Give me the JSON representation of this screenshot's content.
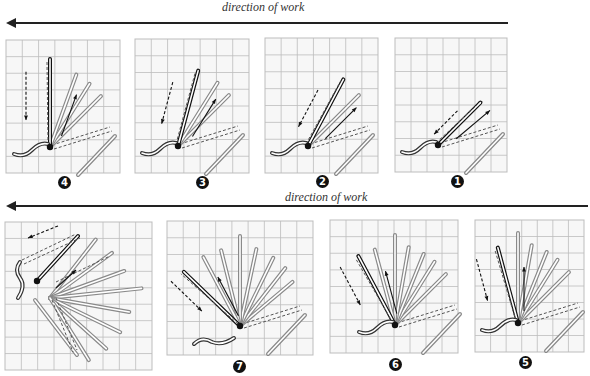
{
  "rows": [
    {
      "direction_label": "direction of work"
    },
    {
      "direction_label": "direction of work"
    }
  ],
  "panels": [
    {
      "id": "p4",
      "step": "4",
      "stage": 4,
      "variant": "fan"
    },
    {
      "id": "p3",
      "step": "3",
      "stage": 3,
      "variant": "fan"
    },
    {
      "id": "p2",
      "step": "2",
      "stage": 2,
      "variant": "fan"
    },
    {
      "id": "p1",
      "step": "1",
      "stage": 1,
      "variant": "fan"
    },
    {
      "id": "p8",
      "step": "",
      "stage": 8,
      "variant": "full-circle"
    },
    {
      "id": "p7",
      "step": "7",
      "stage": 7,
      "variant": "fan"
    },
    {
      "id": "p6",
      "step": "6",
      "stage": 6,
      "variant": "fan"
    },
    {
      "id": "p5",
      "step": "5",
      "stage": 5,
      "variant": "fan"
    }
  ],
  "colors": {
    "grid": "#bdbdbd",
    "grid_bg": "#f7f7f7",
    "ink": "#111111",
    "stitch_fill": "#ffffff",
    "stitch_outline": "#8a8a8a"
  }
}
